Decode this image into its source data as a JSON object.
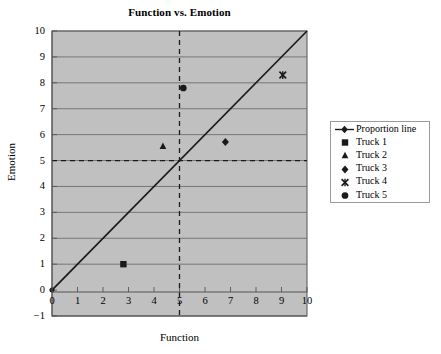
{
  "chart_data": {
    "type": "scatter",
    "title": "Function vs. Emotion",
    "xlabel": "Function",
    "ylabel": "Emotion",
    "xlim": [
      0,
      10
    ],
    "ylim": [
      -1,
      10
    ],
    "xticks": [
      "0",
      "1",
      "2",
      "3",
      "4",
      "5",
      "6",
      "7",
      "8",
      "9",
      "10"
    ],
    "yticks": [
      "10",
      "9",
      "8",
      "7",
      "6",
      "5",
      "4",
      "3",
      "2",
      "1",
      "0",
      "−1"
    ],
    "grid": "horizontal",
    "legend_position": "right",
    "plot_background": "#c0c0c0",
    "series": [
      {
        "name": "Proportion line",
        "marker": "line",
        "type": "line",
        "points": [
          [
            0,
            0
          ],
          [
            10,
            10
          ]
        ],
        "color": "#1a1a1a"
      },
      {
        "name": "Truck 1",
        "marker": "square",
        "points": [
          [
            2.8,
            1.0
          ]
        ],
        "color": "#1a1a1a"
      },
      {
        "name": "Truck 2",
        "marker": "triangle",
        "points": [
          [
            4.35,
            5.55
          ]
        ],
        "color": "#1a1a1a"
      },
      {
        "name": "Truck 3",
        "marker": "diamond",
        "points": [
          [
            6.8,
            5.72
          ]
        ],
        "color": "#1a1a1a"
      },
      {
        "name": "Truck 4",
        "marker": "x",
        "points": [
          [
            9.05,
            8.3
          ]
        ],
        "color": "#1a1a1a"
      },
      {
        "name": "Truck 5",
        "marker": "circle",
        "points": [
          [
            5.15,
            7.8
          ]
        ],
        "color": "#1a1a1a"
      }
    ],
    "reference_lines": [
      {
        "orientation": "vertical",
        "value": 5,
        "style": "dashed"
      },
      {
        "orientation": "horizontal",
        "value": 5,
        "style": "dashed"
      }
    ],
    "annotations": []
  },
  "legend": {
    "items": [
      {
        "label": "Proportion line",
        "marker": "line"
      },
      {
        "label": "Truck 1",
        "marker": "square"
      },
      {
        "label": "Truck 2",
        "marker": "triangle"
      },
      {
        "label": "Truck 3",
        "marker": "diamond"
      },
      {
        "label": "Truck 4",
        "marker": "x"
      },
      {
        "label": "Truck 5",
        "marker": "circle"
      }
    ]
  }
}
